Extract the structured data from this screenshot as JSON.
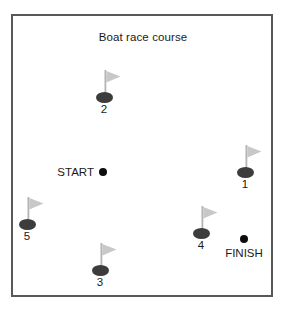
{
  "figure": {
    "title": "Boat race course",
    "border_color": "#585858",
    "background_color": "#ffffff",
    "width": 286,
    "height": 310
  },
  "colors": {
    "flag_fill": "#c8c8c8",
    "flag_pole": "#b4b4b4",
    "buoy_base": "#3c3c3c",
    "point_dot": "#0d0d0d",
    "text": "#1a1a1a"
  },
  "buoys": [
    {
      "label": "2",
      "icon": "buoy-flag-icon",
      "x": 104,
      "y": 97
    },
    {
      "label": "1",
      "icon": "buoy-flag-icon",
      "x": 245,
      "y": 172
    },
    {
      "label": "5",
      "icon": "buoy-flag-icon",
      "x": 27,
      "y": 224
    },
    {
      "label": "4",
      "icon": "buoy-flag-icon",
      "x": 201,
      "y": 233
    },
    {
      "label": "3",
      "icon": "buoy-flag-icon",
      "x": 100,
      "y": 270
    }
  ],
  "points": [
    {
      "label": "START",
      "icon": "dot-icon",
      "x": 103,
      "y": 172,
      "label_position": "left"
    },
    {
      "label": "FINISH",
      "icon": "dot-icon",
      "x": 244,
      "y": 239,
      "label_position": "below"
    }
  ]
}
